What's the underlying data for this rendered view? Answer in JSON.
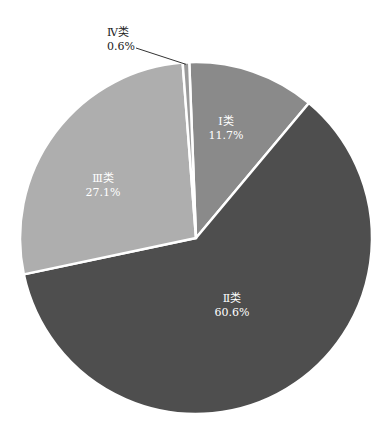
{
  "chart_data": {
    "type": "pie",
    "title": "",
    "categories": [
      "Ⅰ类",
      "Ⅱ类",
      "Ⅲ类",
      "Ⅳ类"
    ],
    "values": [
      11.7,
      60.6,
      27.1,
      0.6
    ],
    "value_labels": [
      "11.7%",
      "60.6%",
      "27.1%",
      "0.6%"
    ],
    "colors": [
      "#8a8a8a",
      "#4e4e4e",
      "#aeaeae",
      "#9a9a9a"
    ],
    "start_angle_deg": 0,
    "direction": "clockwise",
    "legend": "none",
    "annotations": [
      {
        "category": "Ⅳ类",
        "leader_line": true
      }
    ]
  },
  "labels": {
    "i": {
      "name": "Ⅰ类",
      "pct": "11.7%"
    },
    "ii": {
      "name": "Ⅱ类",
      "pct": "60.6%"
    },
    "iii": {
      "name": "Ⅲ类",
      "pct": "27.1%"
    },
    "iv": {
      "name": "Ⅳ类",
      "pct": "0.6%"
    }
  }
}
